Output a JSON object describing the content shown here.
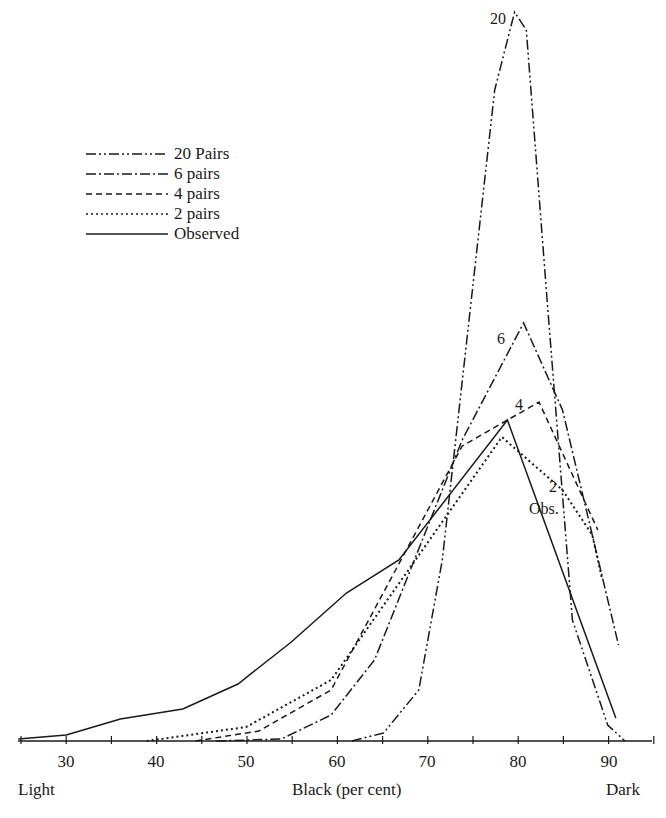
{
  "chart_data": {
    "type": "line",
    "title": "",
    "xlabel": "Black (per cent)",
    "xlabel_left": "Light",
    "xlabel_right": "Dark",
    "ylabel": "",
    "xlim": [
      25,
      95
    ],
    "ylim": [
      0,
      75
    ],
    "grid": false,
    "legend_position": "upper-left",
    "x_ticks": [
      30,
      40,
      50,
      60,
      70,
      80,
      90
    ],
    "x_minor_step": 5,
    "series": [
      {
        "name": "20 Pairs",
        "style": "dash-dot-dot",
        "label": "20",
        "points": [
          [
            61.6,
            0
          ],
          [
            65.1,
            0.8
          ],
          [
            69.0,
            5.1
          ],
          [
            71.6,
            18.1
          ],
          [
            77.4,
            65.1
          ],
          [
            79.6,
            72.9
          ],
          [
            80.9,
            71.1
          ],
          [
            83.2,
            44.1
          ],
          [
            86.0,
            12.1
          ],
          [
            89.9,
            1.6
          ],
          [
            91.8,
            0
          ]
        ]
      },
      {
        "name": "6 pairs",
        "style": "dash-dot",
        "label": "6",
        "points": [
          [
            46.6,
            0
          ],
          [
            53.8,
            0.2
          ],
          [
            59.3,
            2.6
          ],
          [
            64.1,
            8.1
          ],
          [
            73.8,
            30.1
          ],
          [
            80.6,
            41.8
          ],
          [
            84.9,
            33.1
          ],
          [
            91.1,
            9.6
          ]
        ]
      },
      {
        "name": "4 pairs",
        "style": "dashed",
        "label": "4",
        "points": [
          [
            44.3,
            0
          ],
          [
            51.3,
            1.0
          ],
          [
            59.3,
            5.1
          ],
          [
            73.8,
            29.5
          ],
          [
            82.3,
            33.9
          ],
          [
            88.8,
            21.1
          ]
        ]
      },
      {
        "name": "2 pairs",
        "style": "dotted",
        "label": "2",
        "points": [
          [
            38.9,
            0
          ],
          [
            49.9,
            1.4
          ],
          [
            59.3,
            6.1
          ],
          [
            78.2,
            30.4
          ],
          [
            84.9,
            25.1
          ],
          [
            88.2,
            20.6
          ],
          [
            89.3,
            16.1
          ]
        ]
      },
      {
        "name": "Observed",
        "style": "solid",
        "label": "Obs.",
        "points": [
          [
            24.7,
            0.2
          ],
          [
            30.0,
            0.6
          ],
          [
            36.0,
            2.2
          ],
          [
            42.9,
            3.2
          ],
          [
            49.0,
            5.7
          ],
          [
            54.9,
            9.9
          ],
          [
            61.0,
            14.8
          ],
          [
            66.8,
            18.1
          ],
          [
            78.8,
            32.1
          ],
          [
            90.8,
            2.3
          ]
        ]
      }
    ]
  },
  "legend": [
    {
      "label": "20 Pairs",
      "dash": "10 3 2 3 2 3"
    },
    {
      "label": "6 pairs",
      "dash": "10 3 2 3"
    },
    {
      "label": "4 pairs",
      "dash": "6 4"
    },
    {
      "label": "2 pairs",
      "dash": "2 3"
    },
    {
      "label": "Observed",
      "dash": ""
    }
  ],
  "axis": {
    "ticks": [
      "30",
      "40",
      "50",
      "60",
      "70",
      "80",
      "90"
    ],
    "left_label": "Light",
    "center_label": "Black (per cent)",
    "right_label": "Dark"
  },
  "curve_labels": {
    "c20": "20",
    "c6": "6",
    "c4": "4",
    "c2": "2",
    "obs": "Obs."
  }
}
